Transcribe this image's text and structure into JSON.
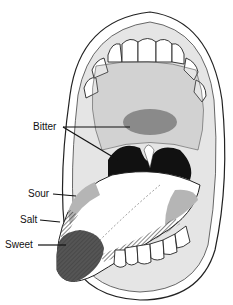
{
  "diagram": {
    "labels": [
      {
        "id": "bitter",
        "text": "Bitter",
        "x": 33,
        "y": 122
      },
      {
        "id": "sour",
        "text": "Sour",
        "x": 28,
        "y": 189
      },
      {
        "id": "salt",
        "text": "Salt",
        "x": 20,
        "y": 214
      },
      {
        "id": "sweet",
        "text": "Sweet",
        "x": 5,
        "y": 239
      }
    ],
    "colors": {
      "taste_zone": "#8a8a8a",
      "sweet_zone": "#555555",
      "line_art": "#222222",
      "shadow": "#111111"
    }
  }
}
